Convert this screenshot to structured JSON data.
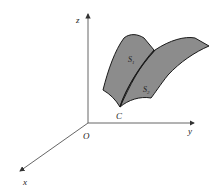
{
  "diagram": {
    "axes": {
      "x_label": "x",
      "y_label": "y",
      "z_label": "z",
      "origin_label": "O"
    },
    "surfaces": [
      {
        "label": "S",
        "subscript": "1"
      },
      {
        "label": "S",
        "subscript": "2"
      }
    ],
    "curve_label": "C",
    "colors": {
      "surface_fill": "#8c8c8c",
      "outline": "#1a1a1a",
      "axis": "#333333"
    }
  }
}
